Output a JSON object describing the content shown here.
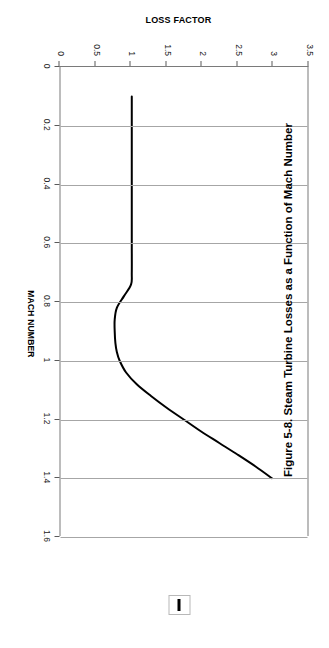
{
  "caption": "Figure 5-8. Steam Turbine Losses as a Function of Mach Number",
  "legend": {
    "swatch_name": "series-1-swatch",
    "color": "#000000"
  },
  "chart_data": {
    "type": "line",
    "title": "",
    "xlabel": "MACH NUMBER",
    "ylabel": "LOSS FACTOR",
    "xlim": [
      0,
      1.6
    ],
    "ylim": [
      0,
      3.5
    ],
    "xticks": [
      "0",
      "0.2",
      "0.4",
      "0.6",
      "0.8",
      "1",
      "1.2",
      "1.4",
      "1.6"
    ],
    "xtick_values": [
      0,
      0.2,
      0.4,
      0.6,
      0.8,
      1,
      1.2,
      1.4,
      1.6
    ],
    "yticks": [
      "0",
      "0.5",
      "1",
      "1.5",
      "2",
      "2.5",
      "3",
      "3.5"
    ],
    "ytick_values": [
      0,
      0.5,
      1,
      1.5,
      2,
      2.5,
      3,
      3.5
    ],
    "grid": "vertical-gridlines-on-mach-axis",
    "legend_position": "top-right",
    "rotation": "chart rotated 90 degrees clockwise on page",
    "series": [
      {
        "name": "Loss factor",
        "color": "#000000",
        "line_width": 2,
        "x": [
          0.1,
          0.2,
          0.3,
          0.4,
          0.5,
          0.6,
          0.7,
          0.74,
          0.78,
          0.82,
          0.86,
          0.9,
          0.94,
          0.97,
          1.0,
          1.04,
          1.08,
          1.12,
          1.16,
          1.2,
          1.24,
          1.28,
          1.32,
          1.36,
          1.4
        ],
        "y": [
          1.03,
          1.03,
          1.03,
          1.03,
          1.03,
          1.03,
          1.03,
          1.02,
          0.92,
          0.82,
          0.79,
          0.79,
          0.8,
          0.82,
          0.86,
          0.95,
          1.1,
          1.3,
          1.52,
          1.76,
          2.0,
          2.26,
          2.52,
          2.77,
          3.0
        ]
      }
    ]
  }
}
